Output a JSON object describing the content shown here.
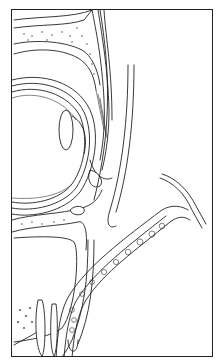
{
  "figure": {
    "type": "anatomical-line-illustration",
    "structures": [
      "orbital-roof-bone",
      "eyelid",
      "globe",
      "lens",
      "orbital-floor",
      "maxillary-sinus",
      "maxillary-alveolar-bone",
      "cheek-soft-tissue",
      "retractor-instrument"
    ],
    "colors": {
      "line": "#222222",
      "background": "#ffffff",
      "border": "#222222"
    }
  }
}
